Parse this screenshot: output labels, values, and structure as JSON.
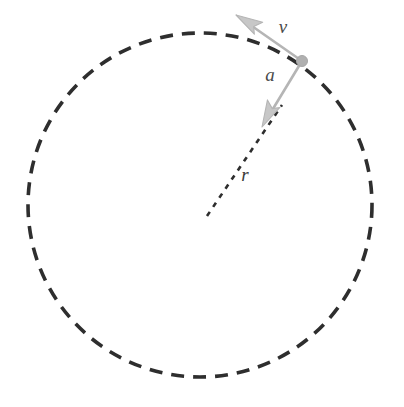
{
  "figure": {
    "kind": "physics-vector-diagram",
    "background_color": "#ffffff",
    "width": 404,
    "height": 407
  },
  "circle": {
    "name": "dashed circular path",
    "center_x": 200,
    "center_y": 205,
    "radius": 172,
    "stroke_color": "#2e2e2e",
    "stroke_width": 3.6,
    "dash_length": 13,
    "dash_gap": 9,
    "style": "dashed"
  },
  "particle": {
    "label": "",
    "x": 302,
    "y": 61,
    "radius": 5.5,
    "color": "#b0b0b0"
  },
  "vectors": [
    {
      "id": "velocity",
      "label": "v",
      "description": "tangential velocity vector",
      "from_x": 302,
      "from_y": 61,
      "to_x": 236,
      "to_y": 15,
      "color": "#b5b5b5",
      "stroke_width": 2.6,
      "label_x": 283,
      "label_y": 33
    },
    {
      "id": "acceleration",
      "label": "a",
      "description": "centripetal acceleration vector pointing toward center",
      "from_x": 302,
      "from_y": 61,
      "to_x": 262,
      "to_y": 127,
      "color": "#b5b5b5",
      "stroke_width": 2.6,
      "label_x": 270,
      "label_y": 81
    }
  ],
  "radius_line": {
    "id": "radius",
    "label": "r",
    "description": "dashed radius from center to particle",
    "from_x": 207,
    "from_y": 216,
    "to_x": 282,
    "to_y": 105,
    "color": "#2e2e2e",
    "stroke_width": 2.6,
    "dash_length": 5,
    "dash_gap": 6,
    "label_x": 245,
    "label_y": 181
  }
}
